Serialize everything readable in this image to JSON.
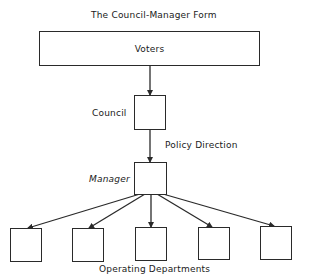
{
  "diagram": {
    "title": "The Council-Manager Form",
    "nodes": {
      "voters": "Voters",
      "council": "Council",
      "manager": "Manager"
    },
    "edge_labels": {
      "council_to_manager": "Policy Direction"
    },
    "departments_label": "Operating Departments",
    "department_count": 5,
    "edges": [
      {
        "from": "Voters",
        "to": "Council"
      },
      {
        "from": "Council",
        "to": "Manager",
        "label": "Policy Direction"
      },
      {
        "from": "Manager",
        "to": "Department 1"
      },
      {
        "from": "Manager",
        "to": "Department 2"
      },
      {
        "from": "Manager",
        "to": "Department 3"
      },
      {
        "from": "Manager",
        "to": "Department 4"
      },
      {
        "from": "Manager",
        "to": "Department 5"
      }
    ],
    "colors": {
      "line": "#2a2a2a",
      "background": "#ffffff"
    }
  }
}
